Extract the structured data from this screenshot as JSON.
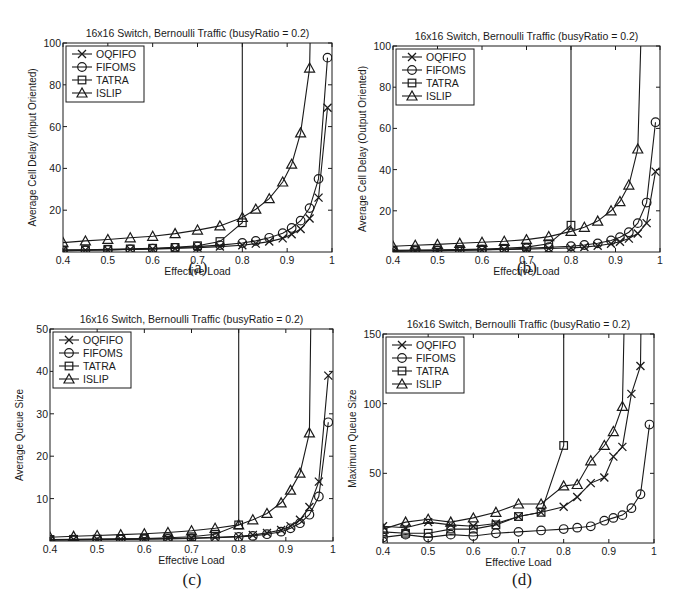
{
  "figure": {
    "captions": [
      "(a)",
      "(b)",
      "(c)",
      "(d)"
    ]
  },
  "legend": {
    "entries": [
      {
        "name": "OQFIFO",
        "marker": "x-marker-icon"
      },
      {
        "name": "FIFOMS",
        "marker": "circle-marker-icon"
      },
      {
        "name": "TATRA",
        "marker": "square-marker-icon"
      },
      {
        "name": "ISLIP",
        "marker": "triangle-marker-icon"
      }
    ]
  },
  "colors": {
    "ink": "#1a1a1a",
    "background": "#ffffff"
  },
  "chart_data": [
    {
      "id": "a",
      "type": "line",
      "title": "16x16 Switch, Bernoulli Traffic (busyRatio = 0.2)",
      "xlabel": "Effective Load",
      "ylabel": "Average Cell Delay (Input Oriented)",
      "xlim": [
        0.4,
        1.0
      ],
      "ylim": [
        0,
        100
      ],
      "xticks": [
        0.4,
        0.5,
        0.6,
        0.7,
        0.8,
        0.9,
        1
      ],
      "xtick_labels": [
        "0.4",
        "0.5",
        "0.6",
        "0.7",
        "0.8",
        "0.9",
        "1"
      ],
      "yticks": [
        20,
        40,
        60,
        80,
        100
      ],
      "ytick_labels": [
        "20",
        "40",
        "60",
        "80",
        "100"
      ],
      "grid": false,
      "legend_position": "upper-left",
      "frame": {
        "left": 63,
        "top": 43,
        "right": 332,
        "bottom": 252
      },
      "series": [
        {
          "name": "OQFIFO",
          "marker": "x",
          "x": [
            0.4,
            0.45,
            0.5,
            0.55,
            0.6,
            0.65,
            0.7,
            0.75,
            0.8,
            0.83,
            0.86,
            0.89,
            0.91,
            0.93,
            0.95,
            0.97,
            0.99
          ],
          "y": [
            0.8,
            0.9,
            1.0,
            1.2,
            1.4,
            1.7,
            2.1,
            2.6,
            3.2,
            4.0,
            5.0,
            6.5,
            8.5,
            11,
            16,
            26,
            69
          ]
        },
        {
          "name": "FIFOMS",
          "marker": "o",
          "x": [
            0.4,
            0.45,
            0.5,
            0.55,
            0.6,
            0.65,
            0.7,
            0.75,
            0.8,
            0.83,
            0.86,
            0.89,
            0.91,
            0.93,
            0.95,
            0.97,
            0.99
          ],
          "y": [
            0.5,
            0.8,
            1.0,
            1.3,
            1.6,
            2.0,
            2.6,
            3.3,
            4.3,
            5.3,
            6.8,
            9.0,
            11.5,
            15,
            21,
            35,
            93
          ]
        },
        {
          "name": "TATRA",
          "marker": "s",
          "x": [
            0.4,
            0.45,
            0.5,
            0.55,
            0.6,
            0.65,
            0.7,
            0.75,
            0.8,
            0.8
          ],
          "y": [
            1.0,
            1.1,
            1.3,
            1.5,
            1.8,
            2.2,
            3.0,
            5.0,
            14,
            200
          ]
        },
        {
          "name": "ISLIP",
          "marker": "^",
          "x": [
            0.4,
            0.45,
            0.5,
            0.55,
            0.6,
            0.65,
            0.7,
            0.75,
            0.8,
            0.83,
            0.86,
            0.89,
            0.91,
            0.93,
            0.95,
            0.96
          ],
          "y": [
            4.5,
            5.3,
            6.0,
            6.8,
            7.5,
            8.8,
            10.5,
            12.5,
            16.5,
            20.5,
            25.5,
            33.5,
            42,
            57,
            88,
            200
          ]
        }
      ]
    },
    {
      "id": "b",
      "type": "line",
      "title": "16x16 Switch, Bernoulli Traffic (busyRatio = 0.2)",
      "xlabel": "Effective Load",
      "ylabel": "Average Cell Delay (Output Oriented)",
      "xlim": [
        0.4,
        1.0
      ],
      "ylim": [
        0,
        100
      ],
      "xticks": [
        0.4,
        0.5,
        0.6,
        0.7,
        0.8,
        0.9,
        1
      ],
      "xtick_labels": [
        "0.4",
        "0.5",
        "0.6",
        "0.7",
        "0.8",
        "0.9",
        "1"
      ],
      "yticks": [
        20,
        40,
        60,
        80,
        100
      ],
      "ytick_labels": [
        "20",
        "40",
        "60",
        "80",
        "100"
      ],
      "grid": false,
      "legend_position": "upper-left",
      "frame": {
        "left": 393,
        "top": 46,
        "right": 660,
        "bottom": 252
      },
      "series": [
        {
          "name": "OQFIFO",
          "marker": "x",
          "x": [
            0.4,
            0.45,
            0.5,
            0.55,
            0.6,
            0.65,
            0.7,
            0.75,
            0.8,
            0.83,
            0.86,
            0.89,
            0.91,
            0.93,
            0.95,
            0.97,
            0.99
          ],
          "y": [
            0.5,
            0.6,
            0.7,
            0.8,
            1.0,
            1.2,
            1.4,
            1.7,
            2.0,
            2.4,
            3.0,
            4.0,
            5.0,
            6.5,
            9.0,
            14,
            39
          ]
        },
        {
          "name": "FIFOMS",
          "marker": "o",
          "x": [
            0.4,
            0.45,
            0.5,
            0.55,
            0.6,
            0.65,
            0.7,
            0.75,
            0.8,
            0.83,
            0.86,
            0.89,
            0.91,
            0.93,
            0.95,
            0.97,
            0.99
          ],
          "y": [
            0.3,
            0.5,
            0.7,
            0.9,
            1.1,
            1.4,
            1.8,
            2.3,
            2.8,
            3.4,
            4.2,
            5.6,
            7.2,
            9.6,
            14,
            24,
            63
          ]
        },
        {
          "name": "TATRA",
          "marker": "s",
          "x": [
            0.4,
            0.45,
            0.5,
            0.55,
            0.6,
            0.65,
            0.7,
            0.75,
            0.8,
            0.8
          ],
          "y": [
            0.8,
            0.9,
            1.0,
            1.2,
            1.4,
            1.8,
            2.4,
            4.0,
            13,
            200
          ]
        },
        {
          "name": "ISLIP",
          "marker": "^",
          "x": [
            0.4,
            0.45,
            0.5,
            0.55,
            0.6,
            0.65,
            0.7,
            0.75,
            0.8,
            0.83,
            0.86,
            0.89,
            0.91,
            0.93,
            0.95,
            0.97
          ],
          "y": [
            2.8,
            3.3,
            3.7,
            4.2,
            4.7,
            5.2,
            6.0,
            7.5,
            10,
            12,
            15,
            20,
            24.5,
            32.5,
            50,
            200
          ]
        }
      ]
    },
    {
      "id": "c",
      "type": "line",
      "title": "16x16 Switch, Bernoulli Traffic (busyRatio = 0.2)",
      "xlabel": "Effective Load",
      "ylabel": "Average Queue Size",
      "xlim": [
        0.4,
        1.0
      ],
      "ylim": [
        0,
        50
      ],
      "xticks": [
        0.4,
        0.5,
        0.6,
        0.7,
        0.8,
        0.9,
        1
      ],
      "xtick_labels": [
        "0.4",
        "0.5",
        "0.6",
        "0.7",
        "0.8",
        "0.9",
        "1"
      ],
      "yticks": [
        10,
        20,
        30,
        40,
        50
      ],
      "ytick_labels": [
        "10",
        "20",
        "30",
        "40",
        "50"
      ],
      "grid": false,
      "legend_position": "upper-left",
      "frame": {
        "left": 50,
        "top": 329,
        "right": 333,
        "bottom": 541
      },
      "series": [
        {
          "name": "OQFIFO",
          "marker": "x",
          "x": [
            0.4,
            0.45,
            0.5,
            0.55,
            0.6,
            0.65,
            0.7,
            0.75,
            0.8,
            0.83,
            0.86,
            0.89,
            0.91,
            0.93,
            0.95,
            0.97,
            0.99
          ],
          "y": [
            0.3,
            0.35,
            0.4,
            0.45,
            0.5,
            0.6,
            0.7,
            0.85,
            1.1,
            1.4,
            1.9,
            2.6,
            3.5,
            5.0,
            8.0,
            14,
            39
          ]
        },
        {
          "name": "FIFOMS",
          "marker": "o",
          "x": [
            0.4,
            0.45,
            0.5,
            0.55,
            0.6,
            0.65,
            0.7,
            0.75,
            0.8,
            0.83,
            0.86,
            0.89,
            0.91,
            0.93,
            0.95,
            0.97,
            0.99
          ],
          "y": [
            0.2,
            0.25,
            0.3,
            0.35,
            0.4,
            0.5,
            0.6,
            0.75,
            0.95,
            1.2,
            1.6,
            2.2,
            3.0,
            4.2,
            6.2,
            10.5,
            28
          ]
        },
        {
          "name": "TATRA",
          "marker": "s",
          "x": [
            0.4,
            0.45,
            0.5,
            0.55,
            0.6,
            0.65,
            0.7,
            0.75,
            0.8,
            0.8
          ],
          "y": [
            0.35,
            0.4,
            0.45,
            0.5,
            0.6,
            0.75,
            1.0,
            1.6,
            3.8,
            200
          ]
        },
        {
          "name": "ISLIP",
          "marker": "^",
          "x": [
            0.4,
            0.45,
            0.5,
            0.55,
            0.6,
            0.65,
            0.7,
            0.75,
            0.8,
            0.83,
            0.86,
            0.89,
            0.91,
            0.93,
            0.95,
            0.97
          ],
          "y": [
            0.9,
            1.1,
            1.3,
            1.5,
            1.7,
            2.0,
            2.4,
            3.0,
            3.8,
            5.0,
            6.5,
            9.0,
            12,
            16,
            25.5,
            200
          ]
        }
      ]
    },
    {
      "id": "d",
      "type": "line",
      "title": "16x16 Switch, Bernoulli Traffic (busyRatio = 0.2)",
      "xlabel": "Effective Load",
      "ylabel": "Maximum Queue Size",
      "xlim": [
        0.4,
        1.0
      ],
      "ylim": [
        0,
        150
      ],
      "xticks": [
        0.4,
        0.5,
        0.6,
        0.7,
        0.8,
        0.9,
        1
      ],
      "xtick_labels": [
        "0.4",
        "0.5",
        "0.6",
        "0.7",
        "0.8",
        "0.9",
        "1"
      ],
      "yticks": [
        50,
        100,
        150
      ],
      "ytick_labels": [
        "50",
        "100",
        "150"
      ],
      "grid": false,
      "legend_position": "upper-left",
      "frame": {
        "left": 383,
        "top": 334,
        "right": 654,
        "bottom": 543
      },
      "series": [
        {
          "name": "OQFIFO",
          "marker": "x",
          "x": [
            0.4,
            0.45,
            0.5,
            0.55,
            0.6,
            0.65,
            0.7,
            0.75,
            0.8,
            0.83,
            0.86,
            0.89,
            0.91,
            0.93,
            0.95,
            0.97,
            0.98
          ],
          "y": [
            12,
            11,
            15,
            13,
            12,
            14,
            19,
            22,
            26,
            33,
            43,
            47,
            62,
            69,
            107,
            127,
            400
          ]
        },
        {
          "name": "FIFOMS",
          "marker": "o",
          "x": [
            0.4,
            0.4,
            0.45,
            0.5,
            0.55,
            0.6,
            0.65,
            0.7,
            0.75,
            0.8,
            0.83,
            0.86,
            0.89,
            0.91,
            0.93,
            0.95,
            0.97,
            0.99
          ],
          "y": [
            1,
            4,
            6,
            4,
            6,
            5,
            7,
            8,
            9,
            10,
            11,
            12,
            16,
            18,
            20,
            25,
            35,
            85
          ]
        },
        {
          "name": "TATRA",
          "marker": "s",
          "x": [
            0.4,
            0.45,
            0.5,
            0.55,
            0.6,
            0.65,
            0.7,
            0.75,
            0.8,
            0.8
          ],
          "y": [
            8,
            7,
            7,
            10,
            10,
            13,
            19,
            22,
            70,
            400
          ]
        },
        {
          "name": "ISLIP",
          "marker": "^",
          "x": [
            0.4,
            0.45,
            0.5,
            0.55,
            0.6,
            0.65,
            0.7,
            0.75,
            0.8,
            0.83,
            0.86,
            0.89,
            0.91,
            0.93,
            0.95
          ],
          "y": [
            10,
            15,
            17,
            15,
            18,
            22,
            28,
            28,
            41,
            42,
            59,
            70,
            80,
            98,
            400
          ]
        }
      ]
    }
  ]
}
